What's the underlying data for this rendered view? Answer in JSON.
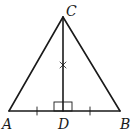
{
  "diagram": {
    "type": "geometry",
    "points": {
      "A": {
        "label": "A",
        "x": 9,
        "y": 111
      },
      "B": {
        "label": "B",
        "x": 120,
        "y": 111
      },
      "C": {
        "label": "C",
        "x": 63,
        "y": 17
      },
      "D": {
        "label": "D",
        "x": 63,
        "y": 111
      }
    },
    "segments": [
      "AC",
      "BC",
      "AB",
      "CD"
    ],
    "marks": {
      "right_angle_at": "D",
      "equal_ticks": [
        "AD",
        "DB"
      ],
      "cross_mark_on": "CD"
    },
    "colors": {
      "stroke": "#1a1a1a",
      "background": "#ffffff"
    }
  }
}
